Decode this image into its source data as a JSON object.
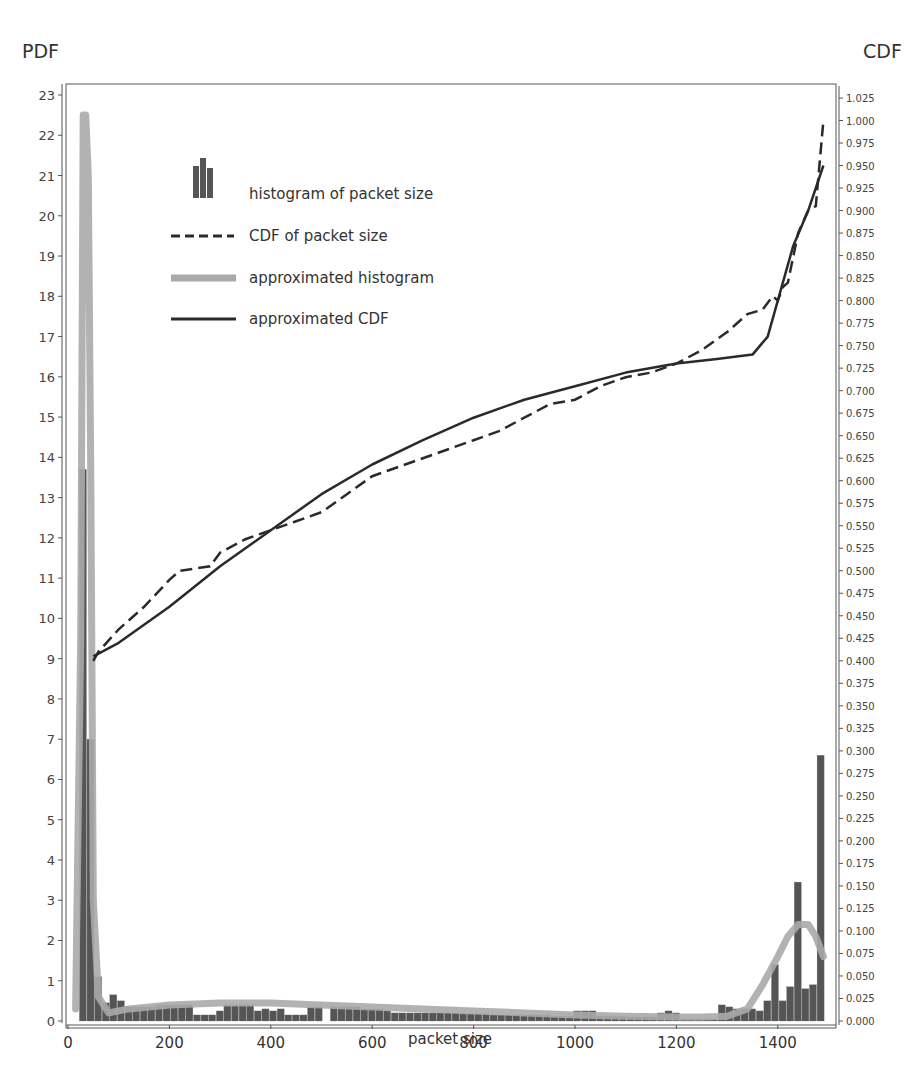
{
  "chart_data": {
    "type": "bar",
    "title": "",
    "xlabel": "packet size",
    "ylabel_left": "PDF",
    "ylabel_right": "CDF",
    "xlim": [
      0,
      1500
    ],
    "ylim_left": [
      0,
      23.5
    ],
    "ylim_right": [
      0,
      1.04
    ],
    "x_ticks": [
      0,
      200,
      400,
      600,
      800,
      1000,
      1200,
      1400
    ],
    "y_ticks_left": [
      0,
      1,
      2,
      3,
      4,
      5,
      6,
      7,
      8,
      9,
      10,
      11,
      12,
      13,
      14,
      15,
      16,
      17,
      18,
      19,
      20,
      21,
      22,
      23
    ],
    "y_ticks_right": [
      "0.000",
      "0.025",
      "0.050",
      "0.075",
      "0.100",
      "0.125",
      "0.150",
      "0.175",
      "0.200",
      "0.225",
      "0.250",
      "0.275",
      "0.300",
      "0.325",
      "0.350",
      "0.375",
      "0.400",
      "0.425",
      "0.450",
      "0.475",
      "0.500",
      "0.525",
      "0.550",
      "0.575",
      "0.600",
      "0.625",
      "0.650",
      "0.675",
      "0.700",
      "0.725",
      "0.750",
      "0.775",
      "0.800",
      "0.825",
      "0.850",
      "0.875",
      "0.900",
      "0.925",
      "0.950",
      "0.975",
      "1.000",
      "1.025"
    ],
    "grid": false,
    "legend_position": "upper-left",
    "legend": [
      "histogram of packet size",
      "CDF of packet size",
      "approximated histogram",
      "approximated CDF"
    ],
    "series": [
      {
        "name": "histogram of packet size",
        "type": "bar",
        "axis": "left",
        "bin_width": 15,
        "x": [
          30,
          45,
          60,
          75,
          90,
          105,
          120,
          135,
          150,
          165,
          180,
          195,
          210,
          225,
          240,
          255,
          270,
          285,
          300,
          315,
          330,
          345,
          360,
          375,
          390,
          405,
          420,
          435,
          450,
          465,
          480,
          495,
          510,
          525,
          540,
          555,
          570,
          585,
          600,
          615,
          630,
          645,
          660,
          675,
          690,
          705,
          720,
          735,
          750,
          765,
          780,
          795,
          810,
          825,
          840,
          855,
          870,
          885,
          900,
          915,
          930,
          945,
          960,
          975,
          990,
          1005,
          1020,
          1035,
          1050,
          1065,
          1080,
          1095,
          1110,
          1125,
          1140,
          1155,
          1170,
          1185,
          1200,
          1215,
          1230,
          1245,
          1260,
          1275,
          1290,
          1305,
          1320,
          1335,
          1350,
          1365,
          1380,
          1395,
          1410,
          1425,
          1440,
          1455,
          1470,
          1485
        ],
        "values": [
          13.7,
          7.0,
          1.1,
          0.45,
          0.65,
          0.5,
          0.35,
          0.35,
          0.35,
          0.35,
          0.4,
          0.4,
          0.4,
          0.4,
          0.4,
          0.15,
          0.15,
          0.15,
          0.25,
          0.4,
          0.4,
          0.4,
          0.4,
          0.25,
          0.3,
          0.25,
          0.3,
          0.15,
          0.15,
          0.15,
          0.35,
          0.35,
          0.0,
          0.35,
          0.35,
          0.35,
          0.35,
          0.3,
          0.3,
          0.3,
          0.25,
          0.2,
          0.2,
          0.2,
          0.2,
          0.2,
          0.2,
          0.2,
          0.2,
          0.2,
          0.18,
          0.18,
          0.18,
          0.18,
          0.15,
          0.15,
          0.15,
          0.15,
          0.15,
          0.15,
          0.15,
          0.15,
          0.12,
          0.12,
          0.12,
          0.25,
          0.25,
          0.25,
          0.12,
          0.12,
          0.12,
          0.12,
          0.1,
          0.1,
          0.1,
          0.1,
          0.2,
          0.25,
          0.2,
          0.05,
          0.05,
          0.05,
          0.05,
          0.05,
          0.4,
          0.35,
          0.3,
          0.3,
          0.3,
          0.25,
          0.5,
          1.4,
          0.5,
          0.85,
          3.45,
          0.8,
          0.9,
          6.6
        ]
      },
      {
        "name": "approximated histogram",
        "type": "line",
        "axis": "left",
        "x": [
          15,
          25,
          30,
          35,
          40,
          45,
          50,
          60,
          80,
          120,
          200,
          300,
          400,
          500,
          600,
          700,
          800,
          900,
          1000,
          1100,
          1200,
          1250,
          1300,
          1340,
          1370,
          1400,
          1420,
          1440,
          1460,
          1475,
          1490
        ],
        "values": [
          0.3,
          9.5,
          22.5,
          22.5,
          21.0,
          13.5,
          3.0,
          0.6,
          0.2,
          0.3,
          0.4,
          0.45,
          0.45,
          0.4,
          0.35,
          0.3,
          0.25,
          0.2,
          0.15,
          0.12,
          0.1,
          0.1,
          0.12,
          0.3,
          0.9,
          1.6,
          2.1,
          2.4,
          2.4,
          2.1,
          1.6
        ]
      },
      {
        "name": "CDF of packet size",
        "type": "line",
        "style": "dashed",
        "axis": "right",
        "x": [
          50,
          60,
          100,
          150,
          200,
          220,
          280,
          300,
          350,
          400,
          450,
          500,
          550,
          600,
          650,
          700,
          750,
          800,
          850,
          900,
          950,
          1000,
          1050,
          1100,
          1150,
          1200,
          1250,
          1300,
          1340,
          1370,
          1390,
          1400,
          1410,
          1420,
          1440,
          1460,
          1475,
          1490
        ],
        "values": [
          0.4,
          0.41,
          0.435,
          0.46,
          0.49,
          0.5,
          0.505,
          0.52,
          0.535,
          0.545,
          0.555,
          0.565,
          0.585,
          0.605,
          0.615,
          0.625,
          0.635,
          0.645,
          0.655,
          0.67,
          0.685,
          0.69,
          0.705,
          0.715,
          0.72,
          0.73,
          0.745,
          0.765,
          0.785,
          0.79,
          0.805,
          0.8,
          0.815,
          0.82,
          0.875,
          0.9,
          0.905,
          1.0
        ]
      },
      {
        "name": "approximated CDF",
        "type": "line",
        "style": "solid",
        "axis": "right",
        "x": [
          50,
          100,
          200,
          300,
          400,
          500,
          600,
          700,
          800,
          900,
          1000,
          1100,
          1200,
          1280,
          1350,
          1380,
          1400,
          1430,
          1460,
          1490
        ],
        "values": [
          0.405,
          0.42,
          0.46,
          0.505,
          0.545,
          0.585,
          0.618,
          0.645,
          0.67,
          0.69,
          0.705,
          0.72,
          0.73,
          0.735,
          0.74,
          0.76,
          0.8,
          0.86,
          0.9,
          0.95
        ]
      }
    ]
  },
  "labels": {
    "pdf_axis_title": "PDF",
    "cdf_axis_title": "CDF",
    "x_axis_title": "packet size"
  },
  "colors": {
    "histogram": "#555555",
    "approx_histogram": "#aaaaaa",
    "cdf": "#2a2a2a",
    "axis": "#555555",
    "text": "#333333"
  }
}
